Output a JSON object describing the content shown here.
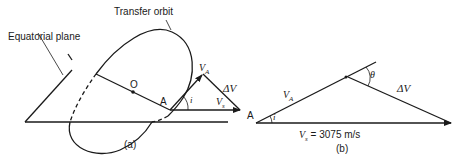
{
  "figure": {
    "panel_a": {
      "caption": "(a)",
      "labels": {
        "transfer_orbit": "Transfer orbit",
        "equatorial_plane": "Equatorial plane",
        "center": "O",
        "point": "A",
        "velocity_a": "V",
        "velocity_a_sub": "A",
        "delta_v": "ΔV",
        "velocity_s": "V",
        "velocity_s_sub": "s",
        "inclination": "i"
      }
    },
    "panel_b": {
      "caption": "(b)",
      "labels": {
        "point": "A",
        "velocity_a": "V",
        "velocity_a_sub": "A",
        "inclination": "i",
        "theta": "θ",
        "delta_v": "ΔV",
        "velocity_s": "V",
        "velocity_s_sub": "s",
        "velocity_s_value": " = 3075 m/s"
      }
    }
  }
}
